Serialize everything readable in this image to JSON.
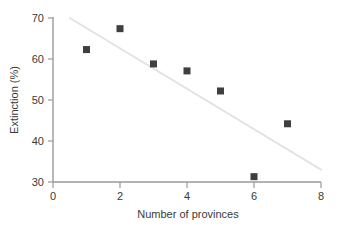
{
  "chart_data": {
    "type": "scatter",
    "title": "",
    "xlabel": "Number of provinces",
    "ylabel": "Extinction (%)",
    "xlim": [
      0,
      8
    ],
    "ylim": [
      30,
      70
    ],
    "xticks": [
      0,
      2,
      4,
      6,
      8
    ],
    "xtick_labels": [
      "0",
      "2",
      "4",
      "6",
      "8"
    ],
    "yticks": [
      30,
      40,
      50,
      60,
      70
    ],
    "ytick_labels": [
      "30",
      "40",
      "50",
      "60",
      "70"
    ],
    "grid": false,
    "legend": null,
    "x": [
      1,
      2,
      3,
      4,
      5,
      6,
      7
    ],
    "values": [
      62.3,
      67.4,
      58.8,
      57.1,
      52.2,
      31.3,
      44.2
    ],
    "series": [
      {
        "name": "Extinction vs provinces",
        "marker": "square",
        "marker_color": "#3f3f3f",
        "marker_size": 7,
        "points": [
          {
            "x": 1,
            "y": 62.3
          },
          {
            "x": 2,
            "y": 67.4
          },
          {
            "x": 3,
            "y": 58.8
          },
          {
            "x": 4,
            "y": 57.1
          },
          {
            "x": 5,
            "y": 52.2
          },
          {
            "x": 6,
            "y": 31.3
          },
          {
            "x": 7,
            "y": 44.2
          }
        ]
      }
    ],
    "trendline": {
      "name": "regression-line",
      "color": "#e3e3e3",
      "width": 2,
      "x_start": 0.5,
      "y_start": 70.0,
      "x_end": 8.0,
      "y_end": 33.0
    },
    "axis_color": "#9a9a9a",
    "text_color": "#3a3a3a"
  }
}
